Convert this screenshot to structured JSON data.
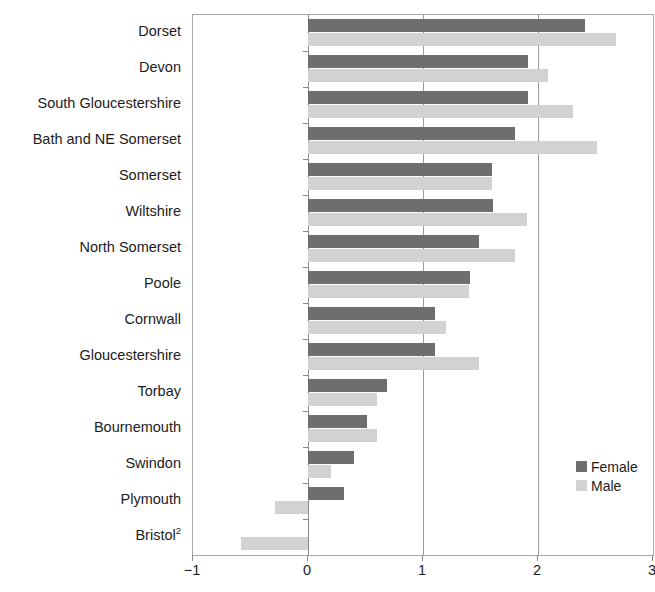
{
  "chart_data": {
    "type": "bar",
    "orientation": "horizontal",
    "title": "",
    "subtitle": "",
    "xlabel": "",
    "ylabel": "",
    "xlim": [
      -1,
      3
    ],
    "grid": true,
    "gridlines_x": [
      -1,
      0,
      1,
      2,
      3
    ],
    "xticks": [
      -1,
      0,
      1,
      2,
      3
    ],
    "xtick_labels": [
      "−1",
      "0",
      "1",
      "2",
      "3"
    ],
    "legend_position": "inside-bottom-right",
    "categories": [
      "Dorset",
      "Devon",
      "South Gloucestershire",
      "Bath and NE Somerset",
      "Somerset",
      "Wiltshire",
      "North Somerset",
      "Poole",
      "Cornwall",
      "Gloucestershire",
      "Torbay",
      "Bournemouth",
      "Swindon",
      "Plymouth",
      "Bristol"
    ],
    "category_footnotes": {
      "Bristol": "2"
    },
    "series": [
      {
        "name": "Female",
        "color": "#6e6e6e",
        "values": [
          2.41,
          1.91,
          1.91,
          1.8,
          1.6,
          1.61,
          1.49,
          1.41,
          1.1,
          1.1,
          0.69,
          0.51,
          0.4,
          0.31,
          0.0
        ]
      },
      {
        "name": "Male",
        "color": "#d2d2d2",
        "values": [
          2.68,
          2.09,
          2.3,
          2.51,
          1.6,
          1.9,
          1.8,
          1.4,
          1.2,
          1.49,
          0.6,
          0.6,
          0.2,
          -0.29,
          -0.58
        ]
      }
    ]
  },
  "legend": {
    "items": [
      {
        "label": "Female",
        "color": "#6e6e6e"
      },
      {
        "label": "Male",
        "color": "#d2d2d2"
      }
    ]
  },
  "colors": {
    "female": "#6e6e6e",
    "male": "#d2d2d2",
    "axis": "#8a8a8a",
    "frame": "#a8a8a8",
    "text": "#1c1c1c",
    "background": "#ffffff"
  }
}
